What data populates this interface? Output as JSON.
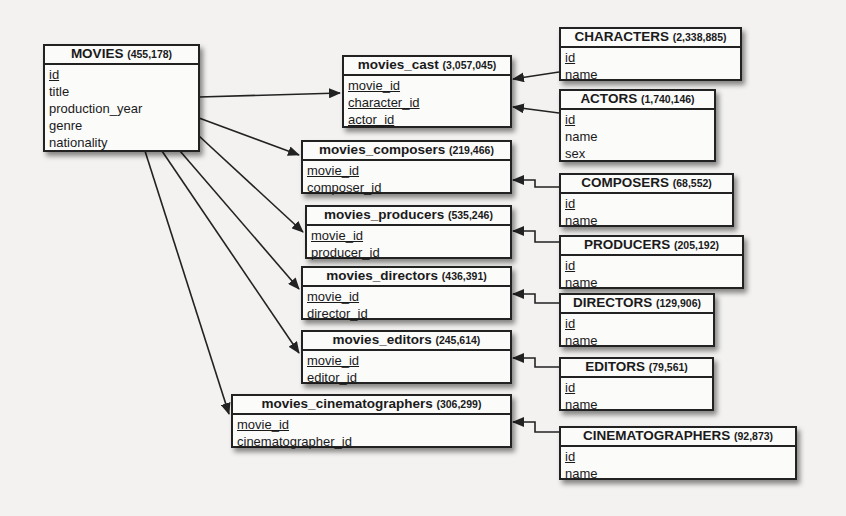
{
  "diagram": {
    "type": "entity-relationship",
    "tables": {
      "movies": {
        "name": "MOVIES",
        "count": "(455,178)",
        "fields": [
          {
            "name": "id",
            "pk": true
          },
          {
            "name": "title",
            "pk": false
          },
          {
            "name": "production_year",
            "pk": false
          },
          {
            "name": "genre",
            "pk": false
          },
          {
            "name": "nationality",
            "pk": false
          }
        ]
      },
      "movies_cast": {
        "name": "movies_cast",
        "count": "(3,057,045)",
        "fields": [
          {
            "name": "movie_id",
            "pk": true
          },
          {
            "name": "character_id",
            "pk": true
          },
          {
            "name": "actor_id",
            "pk": true
          }
        ]
      },
      "characters": {
        "name": "CHARACTERS",
        "count": "(2,338,885)",
        "fields": [
          {
            "name": "id",
            "pk": true
          },
          {
            "name": "name",
            "pk": false
          }
        ]
      },
      "actors": {
        "name": "ACTORS",
        "count": "(1,740,146)",
        "fields": [
          {
            "name": "id",
            "pk": true
          },
          {
            "name": "name",
            "pk": false
          },
          {
            "name": "sex",
            "pk": false
          }
        ]
      },
      "movies_composers": {
        "name": "movies_composers",
        "count": "(219,466)",
        "fields": [
          {
            "name": "movie_id",
            "pk": true
          },
          {
            "name": "composer_id",
            "pk": true
          }
        ]
      },
      "composers": {
        "name": "COMPOSERS",
        "count": "(68,552)",
        "fields": [
          {
            "name": "id",
            "pk": true
          },
          {
            "name": "name",
            "pk": false
          }
        ]
      },
      "movies_producers": {
        "name": "movies_producers",
        "count": "(535,246)",
        "fields": [
          {
            "name": "movie_id",
            "pk": true
          },
          {
            "name": "producer_id",
            "pk": true
          }
        ]
      },
      "producers": {
        "name": "PRODUCERS",
        "count": "(205,192)",
        "fields": [
          {
            "name": "id",
            "pk": true
          },
          {
            "name": "name",
            "pk": false
          }
        ]
      },
      "movies_directors": {
        "name": "movies_directors",
        "count": "(436,391)",
        "fields": [
          {
            "name": "movie_id",
            "pk": true
          },
          {
            "name": "director_id",
            "pk": true
          }
        ]
      },
      "directors": {
        "name": "DIRECTORS",
        "count": "(129,906)",
        "fields": [
          {
            "name": "id",
            "pk": true
          },
          {
            "name": "name",
            "pk": false
          }
        ]
      },
      "movies_editors": {
        "name": "movies_editors",
        "count": "(245,614)",
        "fields": [
          {
            "name": "movie_id",
            "pk": true
          },
          {
            "name": "editor_id",
            "pk": true
          }
        ]
      },
      "editors": {
        "name": "EDITORS",
        "count": "(79,561)",
        "fields": [
          {
            "name": "id",
            "pk": true
          },
          {
            "name": "name",
            "pk": false
          }
        ]
      },
      "movies_cinematographers": {
        "name": "movies_cinematographers",
        "count": "(306,299)",
        "fields": [
          {
            "name": "movie_id",
            "pk": true
          },
          {
            "name": "cinematographer_id",
            "pk": true
          }
        ]
      },
      "cinematographers": {
        "name": "CINEMATOGRAPHERS",
        "count": "(92,873)",
        "fields": [
          {
            "name": "id",
            "pk": true
          },
          {
            "name": "name",
            "pk": false
          }
        ]
      }
    },
    "relationships": [
      {
        "from": "movies",
        "to": "movies_cast"
      },
      {
        "from": "movies",
        "to": "movies_composers"
      },
      {
        "from": "movies",
        "to": "movies_producers"
      },
      {
        "from": "movies",
        "to": "movies_directors"
      },
      {
        "from": "movies",
        "to": "movies_editors"
      },
      {
        "from": "movies",
        "to": "movies_cinematographers"
      },
      {
        "from": "characters",
        "to": "movies_cast"
      },
      {
        "from": "actors",
        "to": "movies_cast"
      },
      {
        "from": "composers",
        "to": "movies_composers"
      },
      {
        "from": "producers",
        "to": "movies_producers"
      },
      {
        "from": "directors",
        "to": "movies_directors"
      },
      {
        "from": "editors",
        "to": "movies_editors"
      },
      {
        "from": "cinematographers",
        "to": "movies_cinematographers"
      }
    ],
    "colors": {
      "line": "#222222",
      "box_fill": "#fbfbfa",
      "background": "#f3f2f0"
    }
  }
}
